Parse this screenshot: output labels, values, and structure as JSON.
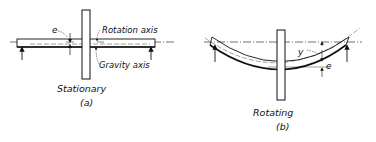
{
  "panel_a": {
    "caption": "Stationary",
    "letter": "(a)",
    "labels": {
      "eccentricity": "e",
      "rotation_axis": "Rotation axis",
      "gravity_axis": "Gravity axis"
    }
  },
  "panel_b": {
    "caption": "Rotating",
    "letter": "(b)",
    "labels": {
      "deflection": "y",
      "eccentricity": "e"
    }
  },
  "colors": {
    "ink": "#111111",
    "background": "#ffffff"
  }
}
